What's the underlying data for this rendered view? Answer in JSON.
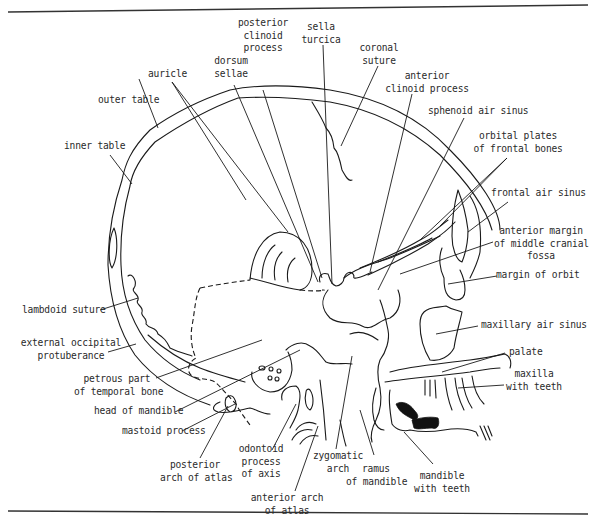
{
  "figure": {
    "caption": "",
    "line_color": "#1a1a1a",
    "background": "#ffffff"
  },
  "labels": {
    "posterior_clinoid_process": "posterior\nclinoid\nprocess",
    "sella_turcica": "sella\nturcica",
    "coronal_suture": "coronal\nsuture",
    "dorsum_sellae": "dorsum\nsellae",
    "auricle": "auricle",
    "anterior_clinoid_process": "anterior\nclinoid process",
    "outer_table": "outer table",
    "sphenoid_air_sinus": "sphenoid air sinus",
    "orbital_plates": "orbital plates\nof frontal bones",
    "inner_table": "inner table",
    "frontal_air_sinus": "frontal air sinus",
    "anterior_margin": "anterior margin\nof middle cranial\nfossa",
    "margin_of_orbit": "margin of orbit",
    "lambdoid_suture": "lambdoid suture",
    "maxillary_air_sinus": "maxillary air sinus",
    "external_occipital_protuberance": "external occipital\nprotuberance",
    "palate": "palate",
    "petrous_part": "petrous part\nof temporal bone",
    "maxilla_with_teeth": "maxilla\nwith teeth",
    "head_of_mandible": "head of mandible",
    "mastoid_process": "mastoid process",
    "posterior_arch_of_atlas": "posterior\narch of atlas",
    "odontoid_process": "odontoid\nprocess\nof axis",
    "zygomatic_arch": "zygomatic\narch",
    "ramus_of_mandible": "ramus\nof mandible",
    "mandible_with_teeth": "mandible\nwith teeth",
    "anterior_arch_of_atlas": "anterior arch\nof atlas"
  }
}
